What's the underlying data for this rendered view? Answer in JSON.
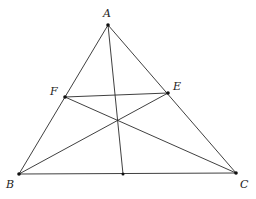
{
  "diagram": {
    "type": "geometry",
    "points": {
      "A": {
        "label": "A",
        "x": 108,
        "y": 25,
        "lx": 103,
        "ly": 17
      },
      "B": {
        "label": "B",
        "x": 19,
        "y": 174,
        "lx": 6,
        "ly": 188
      },
      "C": {
        "label": "C",
        "x": 236,
        "y": 173,
        "lx": 240,
        "ly": 188
      },
      "E": {
        "label": "E",
        "x": 168,
        "y": 93,
        "lx": 173,
        "ly": 90
      },
      "F": {
        "label": "F",
        "x": 65,
        "y": 97,
        "lx": 50,
        "ly": 95
      },
      "D": {
        "label": "",
        "x": 123,
        "y": 174
      }
    },
    "segments": [
      [
        "A",
        "B"
      ],
      [
        "A",
        "C"
      ],
      [
        "B",
        "C"
      ],
      [
        "A",
        "D"
      ],
      [
        "B",
        "E"
      ],
      [
        "C",
        "F"
      ],
      [
        "F",
        "E"
      ]
    ],
    "labels": {
      "A": "A",
      "B": "B",
      "C": "C",
      "E": "E",
      "F": "F"
    }
  }
}
